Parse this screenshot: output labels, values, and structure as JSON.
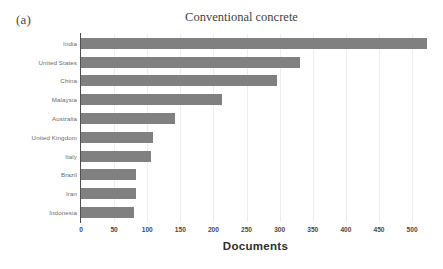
{
  "panel": {
    "label": "(a)"
  },
  "chart_data": {
    "type": "bar",
    "orientation": "horizontal",
    "title": "Conventional concrete",
    "xlabel": "Documents",
    "ylabel": "",
    "xlim": [
      0,
      527
    ],
    "xticks": [
      0,
      50,
      100,
      150,
      200,
      250,
      300,
      350,
      400,
      450,
      500
    ],
    "xticklabels": [
      "0",
      "50",
      "100",
      "150",
      "200",
      "250",
      "300",
      "350",
      "400",
      "450",
      "500"
    ],
    "grid": "vertical-light",
    "legend": "none",
    "bar_color": "#808080",
    "categories": [
      "India",
      "United States",
      "China",
      "Malaysia",
      "Australia",
      "United Kingdom",
      "Italy",
      "Brazil",
      "Iran",
      "Indonesia"
    ],
    "values": [
      523,
      331,
      296,
      213,
      142,
      109,
      106,
      83,
      83,
      80
    ]
  }
}
